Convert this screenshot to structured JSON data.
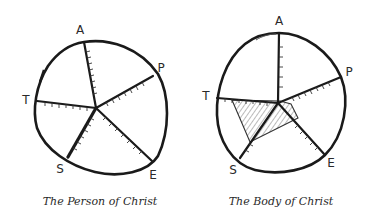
{
  "diagrams": [
    {
      "caption": "The Person of Christ",
      "axes": [
        {
          "label": "A",
          "name": "axis-a"
        },
        {
          "label": "P",
          "name": "axis-p"
        },
        {
          "label": "E",
          "name": "axis-e"
        },
        {
          "label": "S",
          "name": "axis-s"
        },
        {
          "label": "T",
          "name": "axis-t"
        }
      ],
      "filled_region": false
    },
    {
      "caption": "The Body of Christ",
      "axes": [
        {
          "label": "A",
          "name": "axis-a"
        },
        {
          "label": "P",
          "name": "axis-p"
        },
        {
          "label": "E",
          "name": "axis-e"
        },
        {
          "label": "S",
          "name": "axis-s"
        },
        {
          "label": "T",
          "name": "axis-t"
        }
      ],
      "filled_region": true,
      "filled_region_description": "hatched polygon concentrated toward T and S axes, small near A, P, E"
    }
  ],
  "colors": {
    "ink": "#1a1a1a",
    "background": "#ffffff"
  }
}
